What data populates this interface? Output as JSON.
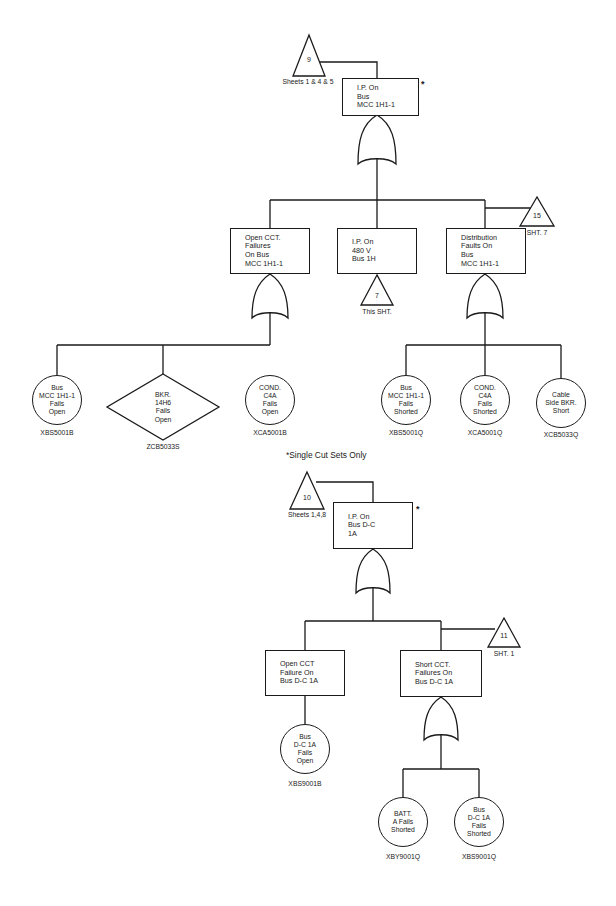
{
  "diagram_title": "Fault Tree - I.P. On Bus MCC 1H1-1 and Bus D-C 1A",
  "tree1": {
    "top_event": {
      "text": "I.P. On\nBus\nMCC 1H1-1",
      "marker": "*"
    },
    "transfer_in": {
      "number": "9",
      "label": "Sheets 1 & 4 & 5"
    },
    "gate": "OR",
    "children": [
      {
        "text": "Open CCT.\nFailures\nOn Bus\nMCC 1H1-1",
        "gate": "OR"
      },
      {
        "text": "I.P. On\n480 V\nBus 1H",
        "transfer": {
          "number": "7",
          "label": "This SHT."
        }
      },
      {
        "text": "Distribution\nFaults On\nBus\nMCC 1H1-1",
        "gate": "OR"
      }
    ],
    "transfer_out": {
      "number": "15",
      "label": "SHT. 7"
    },
    "basic_events": [
      {
        "text": "Bus\nMCC 1H1-1\nFails\nOpen",
        "code": "XBS5001B",
        "shape": "circle"
      },
      {
        "text": "BKR.\n14H6\nFails\nOpen",
        "code": "ZCB5033S",
        "shape": "diamond"
      },
      {
        "text": "COND.\nC4A\nFails\nOpen",
        "code": "XCA5001B",
        "shape": "circle"
      },
      {
        "text": "Bus\nMCC 1H1-1\nFails\nShorted",
        "code": "XBS5001Q",
        "shape": "circle"
      },
      {
        "text": "COND.\nC4A\nFails\nShorted",
        "code": "XCA5001Q",
        "shape": "circle"
      },
      {
        "text": "Cable\nSide BKR.\nShort",
        "code": "XCB5033Q",
        "shape": "circle"
      }
    ]
  },
  "footnote": {
    "marker": "*",
    "text": "Single Cut Sets Only"
  },
  "tree2": {
    "top_event": {
      "text": "I.P. On\nBus D-C\n1A",
      "marker": "*"
    },
    "transfer_in": {
      "number": "10",
      "label": "Sheets 1,4,8"
    },
    "gate": "OR",
    "children": [
      {
        "text": "Open CCT\nFailure On\nBus D-C 1A"
      },
      {
        "text": "Short CCT.\nFailures On\nBus D-C 1A",
        "gate": "OR"
      }
    ],
    "transfer_out": {
      "number": "11",
      "label": "SHT. 1"
    },
    "basic_events": [
      {
        "text": "Bus\nD-C 1A\nFails\nOpen",
        "code": "XBS9001B",
        "shape": "circle"
      },
      {
        "text": "BATT.\nA Fails\nShorted",
        "code": "XBY9001Q",
        "shape": "circle"
      },
      {
        "text": "Bus\nD-C 1A\nFails\nShorted",
        "code": "XBS9001Q",
        "shape": "circle"
      }
    ]
  }
}
